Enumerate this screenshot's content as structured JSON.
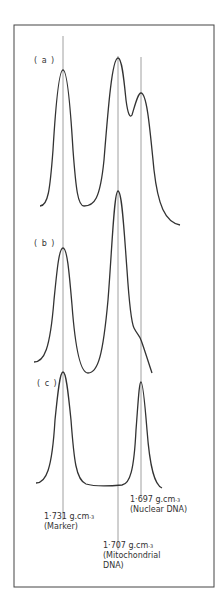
{
  "figure": {
    "panels": [
      {
        "id": "a",
        "label": "( a )"
      },
      {
        "id": "b",
        "label": "( b )"
      },
      {
        "id": "c",
        "label": "( c )"
      }
    ],
    "markers": [
      {
        "id": "marker",
        "density": "1·731 g.cm",
        "exp": "-3",
        "name": "(Marker)"
      },
      {
        "id": "mito",
        "density": "1·707 g.cm",
        "exp": "-3",
        "name": "(Mitochondrial",
        "name2": "DNA)"
      },
      {
        "id": "nuclear",
        "density": "1·697 g.cm",
        "exp": "-3",
        "name": "(Nuclear DNA)"
      }
    ],
    "colors": {
      "line": "#333333",
      "guide": "#888888",
      "frame": "#444444"
    }
  }
}
